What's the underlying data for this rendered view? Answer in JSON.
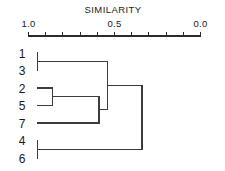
{
  "chart_data": {
    "type": "dendrogram",
    "title": "SIMILARITY",
    "xlabel": "",
    "ylabel": "",
    "orientation": "horizontal-left-to-right",
    "xlim": [
      1.0,
      0.0
    ],
    "axis_reversed": true,
    "grid": false,
    "legend": null,
    "tick_labels": [
      "1.0",
      "0.5",
      "0.0"
    ],
    "tick_label_values": [
      1.0,
      0.5,
      0.0
    ],
    "tick_values": [
      1.0,
      0.9,
      0.8,
      0.7,
      0.6,
      0.5,
      0.4,
      0.3,
      0.2,
      0.1,
      0.0
    ],
    "leaf_labels": [
      "1",
      "3",
      "2",
      "5",
      "7",
      "4",
      "6"
    ],
    "leaf_order": [
      1,
      3,
      2,
      5,
      7,
      4,
      6
    ],
    "merges": [
      {
        "id": "m1",
        "children": [
          "1",
          "3"
        ],
        "similarity": 0.95,
        "members": [
          "1",
          "3"
        ]
      },
      {
        "id": "m2",
        "children": [
          "2",
          "5"
        ],
        "similarity": 0.86,
        "members": [
          "2",
          "5"
        ]
      },
      {
        "id": "m3",
        "children": [
          "m2",
          "7"
        ],
        "similarity": 0.59,
        "members": [
          "2",
          "5",
          "7"
        ]
      },
      {
        "id": "m4",
        "children": [
          "m1",
          "m3"
        ],
        "similarity": 0.54,
        "members": [
          "1",
          "3",
          "2",
          "5",
          "7"
        ]
      },
      {
        "id": "m5",
        "children": [
          "4",
          "6"
        ],
        "similarity": 0.95,
        "members": [
          "4",
          "6"
        ]
      },
      {
        "id": "m6",
        "children": [
          "m4",
          "m5"
        ],
        "similarity": 0.34,
        "members": [
          "1",
          "3",
          "2",
          "5",
          "7",
          "4",
          "6"
        ]
      }
    ],
    "colors": {
      "line": "#3c3c3c",
      "axis": "#2b2b2b",
      "text": "#1a1a1a",
      "background": "#ffffff"
    }
  }
}
